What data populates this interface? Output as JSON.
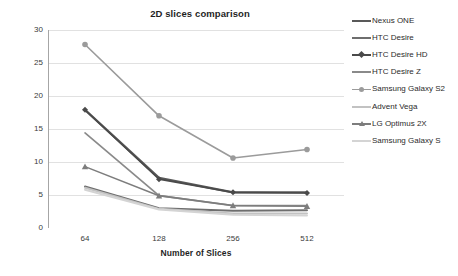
{
  "chart_data": {
    "type": "line",
    "title": "2D slices comparison",
    "xlabel": "Number of Slices",
    "ylabel": "FPS",
    "categories": [
      "64",
      "128",
      "256",
      "512"
    ],
    "ylim": [
      0,
      30
    ],
    "yticks": [
      "0",
      "5",
      "10",
      "15",
      "20",
      "25",
      "30"
    ],
    "grid": true,
    "legend_position": "right",
    "series": [
      {
        "name": "Nexus ONE",
        "values": [
          17.9,
          7.6,
          5.4,
          5.4
        ],
        "color": "#595959",
        "marker": "none",
        "width": 2.2
      },
      {
        "name": "HTC Desire",
        "values": [
          6.3,
          3.0,
          2.6,
          2.7
        ],
        "color": "#6e6e6e",
        "marker": "none",
        "width": 2.0
      },
      {
        "name": "HTC Desire HD",
        "values": [
          17.9,
          7.4,
          5.4,
          5.3
        ],
        "color": "#4a4a4a",
        "marker": "diamond",
        "width": 1.6
      },
      {
        "name": "HTC Desire Z",
        "values": [
          14.4,
          4.9,
          3.4,
          3.4
        ],
        "color": "#8a8a8a",
        "marker": "none",
        "width": 1.7
      },
      {
        "name": "Samsung Galaxy S2",
        "values": [
          27.8,
          17.0,
          10.6,
          11.9
        ],
        "color": "#9b9b9b",
        "marker": "circle",
        "width": 1.6
      },
      {
        "name": "Advent Vega",
        "values": [
          6.1,
          2.9,
          2.2,
          2.2
        ],
        "color": "#c2c2c2",
        "marker": "none",
        "width": 2.0
      },
      {
        "name": "LG Optimus 2X",
        "values": [
          9.3,
          4.9,
          3.4,
          3.3
        ],
        "color": "#7d7d7d",
        "marker": "triangle",
        "width": 1.6
      },
      {
        "name": "Samsung Galaxy S",
        "values": [
          5.8,
          2.8,
          2.0,
          1.9
        ],
        "color": "#d4d4d4",
        "marker": "none",
        "width": 2.0
      }
    ]
  },
  "axis": {
    "y_label": "FPS",
    "x_label": "Number of Slices"
  }
}
